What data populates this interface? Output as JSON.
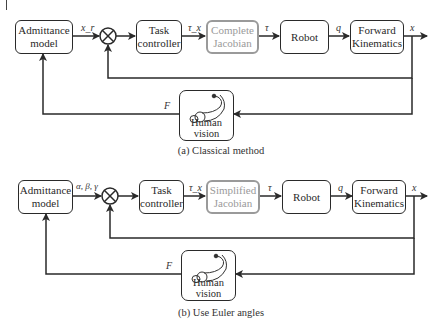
{
  "diagram_a": {
    "caption": "(a) Classical method",
    "blocks": {
      "admittance": "Admittance model",
      "task": "Task controller",
      "jacobian": "Complete Jacobian",
      "robot": "Robot",
      "fk": "Forward Kinematics",
      "human": "Human vision"
    },
    "signals": {
      "ref": "x_r",
      "tau_x": "τ_x",
      "tau": "τ",
      "q": "q",
      "x": "x",
      "F": "F"
    }
  },
  "diagram_b": {
    "caption": "(b) Use Euler angles",
    "blocks": {
      "admittance": "Admittance model",
      "task": "Task controller",
      "jacobian": "Simplified Jacobian",
      "robot": "Robot",
      "fk": "Forward Kinematics",
      "human": "Human vision"
    },
    "signals": {
      "ref": "α, β, γ",
      "tau_x": "τ_x",
      "tau": "τ",
      "q": "q",
      "x": "x",
      "F": "F"
    }
  },
  "colors": {
    "line": "#2a2a2a",
    "highlight_block": "#9a9a9a"
  }
}
